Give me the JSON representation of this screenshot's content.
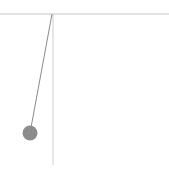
{
  "scene": {
    "type": "pendulum",
    "width": 169,
    "height": 175,
    "colors": {
      "background": "#ffffff",
      "ceiling": "#c8c8c8",
      "reference_line": "#cfcfcf",
      "string": "#8a8a8a",
      "bob": "#8c8c8c"
    },
    "ceiling": {
      "y": 14,
      "x1": 0,
      "x2": 169
    },
    "pivot": {
      "x": 52,
      "y": 14
    },
    "reference_line": {
      "x": 53,
      "y1": 14,
      "y2": 165
    },
    "bob": {
      "x": 30,
      "y": 133,
      "radius": 7.5
    }
  }
}
